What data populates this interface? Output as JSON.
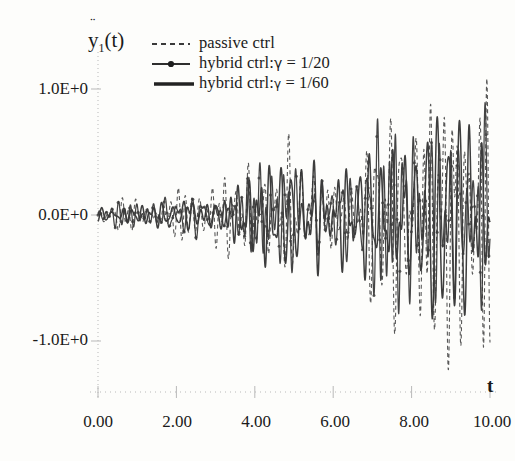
{
  "figure": {
    "background_color": "#fdfdfb",
    "ink_color": "#3a3a3a",
    "axis_color": "#b9b9b9"
  },
  "axis_label_y": {
    "symbol": "y",
    "accent": "¨",
    "subscript": "1",
    "arg": "(t)"
  },
  "axis_label_x": "t",
  "legend": {
    "items": [
      {
        "label": "passive ctrl",
        "style": "dashed",
        "marker": "none"
      },
      {
        "label_pre": "hybrid ctrl:",
        "gamma": "γ",
        "label_post": " = 1/20",
        "style": "line-dot",
        "marker": "dot"
      },
      {
        "label_pre": "hybrid ctrl:",
        "gamma": "γ",
        "label_post": " = 1/60",
        "style": "solid-thick",
        "marker": "none"
      }
    ]
  },
  "chart_data": {
    "type": "line",
    "title": "",
    "xlabel": "t",
    "ylabel": "ÿ1(t)",
    "xlim": [
      0,
      10
    ],
    "ylim": [
      -1.45,
      1.45
    ],
    "grid": false,
    "legend_position": "top-center",
    "xticks": [
      0,
      2,
      4,
      6,
      8,
      10
    ],
    "xticklabels": [
      "0.00",
      "2.00",
      "4.00",
      "6.00",
      "8.00",
      "10.00"
    ],
    "yticks": [
      -1,
      0,
      1
    ],
    "yticklabels": [
      "-1.0E+0",
      "0.0E+0",
      "1.0E+0"
    ],
    "series": [
      {
        "name": "passive ctrl",
        "style": "dashed",
        "color": "#4a4a4a",
        "description": "Largest-amplitude response; envelope grows from ~0.05 at t=0 to ~1.4 peaks near t=9.5",
        "envelope_t": [
          0,
          1,
          2,
          3,
          4,
          5,
          6,
          7,
          8,
          9,
          10
        ],
        "envelope_amplitude": [
          0.06,
          0.14,
          0.24,
          0.34,
          0.46,
          0.58,
          0.72,
          0.95,
          1.1,
          1.38,
          1.05
        ]
      },
      {
        "name": "hybrid ctrl:γ = 1/20",
        "style": "line-dot",
        "color": "#3a3a3a",
        "description": "Intermediate amplitude with round dot markers; envelope grows to ~0.85",
        "envelope_t": [
          0,
          1,
          2,
          3,
          4,
          5,
          6,
          7,
          8,
          9,
          10
        ],
        "envelope_amplitude": [
          0.05,
          0.12,
          0.2,
          0.27,
          0.35,
          0.44,
          0.55,
          0.68,
          0.78,
          0.88,
          0.72
        ]
      },
      {
        "name": "hybrid ctrl:γ = 1/60",
        "style": "solid-thick",
        "color": "#333333",
        "description": "Smallest amplitude solid trace; envelope grows to ~0.70",
        "envelope_t": [
          0,
          1,
          2,
          3,
          4,
          5,
          6,
          7,
          8,
          9,
          10
        ],
        "envelope_amplitude": [
          0.05,
          0.11,
          0.18,
          0.24,
          0.31,
          0.39,
          0.48,
          0.58,
          0.66,
          0.74,
          0.6
        ]
      }
    ]
  }
}
